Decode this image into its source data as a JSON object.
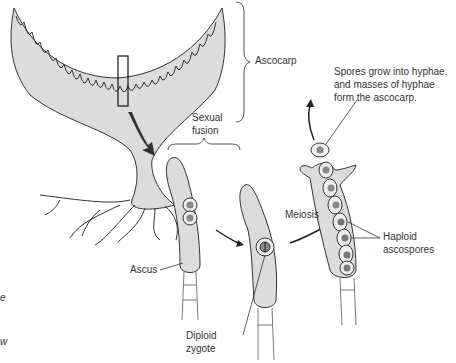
{
  "diagram": {
    "colors": {
      "tissue_fill": "#dcdcdc",
      "outline": "#333333",
      "nucleus_fill": "#8a8a8a",
      "arrow_dark": "#222222"
    },
    "labels": {
      "ascocarp": "Ascocarp",
      "spores_note_line1": "Spores grow into hyphae,",
      "spores_note_line2": "and masses of hyphae",
      "spores_note_line3": "form the ascocarp.",
      "sexual_fusion_line1": "Sexual",
      "sexual_fusion_line2": "fusion",
      "meiosis": "Meiosis",
      "ascus": "Ascus",
      "diploid_line1": "Diploid",
      "diploid_line2": "zygote",
      "haploid_line1": "Haploid",
      "haploid_line2": "ascospores"
    },
    "edge_fragments": [
      "e",
      "w"
    ]
  }
}
